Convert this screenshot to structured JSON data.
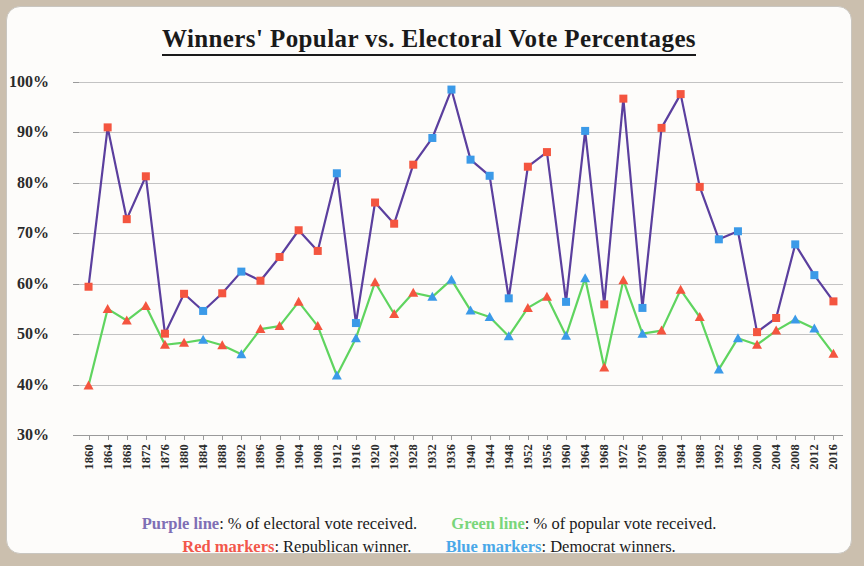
{
  "title": "Winners' Popular  vs.  Electoral Vote Percentages",
  "legend": {
    "purple_key": "Purple line",
    "purple_desc": ":  % of electoral vote received.",
    "green_key": "Green line",
    "green_desc": ":  % of popular vote received.",
    "red_key": "Red markers",
    "red_desc": ":  Republican winner.",
    "blue_key": "Blue markers",
    "blue_desc": ":  Democrat winners."
  },
  "colors": {
    "electoral_line": "#5b3f9e",
    "popular_line": "#5fd45f",
    "republican_marker": "#f4553f",
    "democrat_marker": "#3b9ae8",
    "grid": "#c3c3c3",
    "card": "#fdfcfa",
    "page_background": "#cbbfae"
  },
  "chart_data": {
    "type": "line",
    "title": "Winners' Popular  vs.  Electoral Vote Percentages",
    "xlabel": "",
    "ylabel": "",
    "ylim": [
      30,
      100
    ],
    "ytick_labels": [
      "100%",
      "90%",
      "80%",
      "70%",
      "60%",
      "50%",
      "40%",
      "30%"
    ],
    "ytick_values": [
      100,
      90,
      80,
      70,
      60,
      50,
      40,
      30
    ],
    "grid": true,
    "legend_position": "below-plot",
    "categories": [
      "1860",
      "1864",
      "1868",
      "1872",
      "1876",
      "1880",
      "1884",
      "1888",
      "1892",
      "1896",
      "1900",
      "1904",
      "1908",
      "1912",
      "1916",
      "1920",
      "1924",
      "1928",
      "1932",
      "1936",
      "1940",
      "1944",
      "1948",
      "1952",
      "1956",
      "1960",
      "1964",
      "1968",
      "1972",
      "1976",
      "1980",
      "1984",
      "1988",
      "1992",
      "1996",
      "2000",
      "2004",
      "2008",
      "2012",
      "2016"
    ],
    "party": [
      "R",
      "R",
      "R",
      "R",
      "R",
      "R",
      "D",
      "R",
      "D",
      "R",
      "R",
      "R",
      "R",
      "D",
      "D",
      "R",
      "R",
      "R",
      "D",
      "D",
      "D",
      "D",
      "D",
      "R",
      "R",
      "D",
      "D",
      "R",
      "R",
      "D",
      "R",
      "R",
      "R",
      "D",
      "D",
      "R",
      "R",
      "D",
      "D",
      "R"
    ],
    "series": [
      {
        "name": "% of electoral vote received",
        "color": "#5b3f9e",
        "marker": "square",
        "values": [
          59.4,
          91.0,
          72.8,
          81.3,
          50.1,
          58.0,
          54.6,
          58.1,
          62.4,
          60.6,
          65.3,
          70.6,
          66.5,
          81.9,
          52.2,
          76.1,
          71.9,
          83.6,
          88.9,
          98.5,
          84.6,
          81.4,
          57.1,
          83.2,
          86.1,
          56.4,
          90.3,
          55.9,
          96.7,
          55.2,
          90.9,
          97.6,
          79.2,
          68.8,
          70.4,
          50.4,
          53.2,
          67.8,
          61.7,
          56.5
        ]
      },
      {
        "name": "% of popular vote received",
        "color": "#5fd45f",
        "marker": "triangle",
        "values": [
          39.8,
          55.0,
          52.7,
          55.6,
          47.9,
          48.3,
          48.9,
          47.8,
          46.0,
          51.0,
          51.6,
          56.4,
          51.6,
          41.8,
          49.2,
          60.3,
          54.0,
          58.2,
          57.4,
          60.8,
          54.7,
          53.4,
          49.6,
          55.2,
          57.4,
          49.7,
          61.1,
          43.4,
          60.7,
          50.1,
          50.7,
          58.8,
          53.4,
          43.0,
          49.2,
          47.9,
          50.7,
          52.9,
          51.1,
          46.1
        ]
      }
    ]
  }
}
